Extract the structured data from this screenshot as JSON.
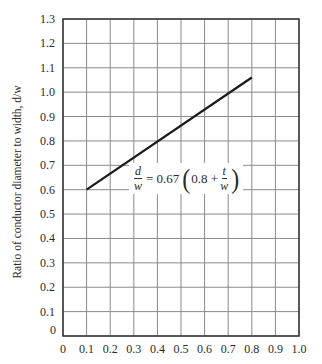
{
  "chart_data": {
    "type": "line",
    "title": "",
    "xlabel": "",
    "ylabel": "Ratio of conductor diameter to width, d/w",
    "xlim": [
      0,
      1.0
    ],
    "ylim": [
      0,
      1.3
    ],
    "x_ticks": [
      "0",
      "0.1",
      "0.2",
      "0.3",
      "0.4",
      "0.5",
      "0.6",
      "0.7",
      "0.8",
      "0.9",
      "1.0"
    ],
    "y_ticks": [
      "0",
      "0.1",
      "0.2",
      "0.3",
      "0.4",
      "0.5",
      "0.6",
      "0.7",
      "0.8",
      "0.9",
      "1.0",
      "1.1",
      "1.2",
      "1.3"
    ],
    "grid": true,
    "series": [
      {
        "name": "d/w = 0.67 (0.8 + t/w)",
        "x": [
          0.1,
          0.8
        ],
        "y": [
          0.6,
          1.06
        ],
        "color": "#1a1a1a"
      }
    ],
    "annotations": [
      {
        "text": "d/w = 0.67 (0.8 + t/w)",
        "parts": {
          "lhs_num": "d",
          "lhs_den": "w",
          "equals": "= 0.67",
          "open": "(",
          "inner": "0.8 +",
          "rhs_num": "t",
          "rhs_den": "w",
          "close": ")"
        }
      }
    ],
    "legend": null
  },
  "colors": {
    "axis": "#333333",
    "grid": "#8a8a8a",
    "line": "#1a1a1a",
    "text": "#2a2a2a"
  }
}
